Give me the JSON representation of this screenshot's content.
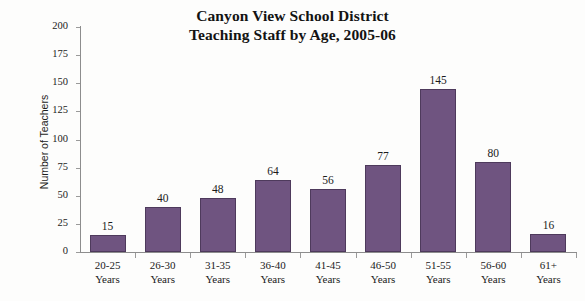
{
  "chart_data": {
    "type": "bar",
    "title": "Canyon View School District\nTeaching Staff by Age, 2005-06",
    "title_line1": "Canyon View School District",
    "title_line2": "Teaching Staff by Age, 2005-06",
    "xlabel": "",
    "ylabel": "Number of Teachers",
    "categories": [
      "20-25 Years",
      "26-30 Years",
      "31-35 Years",
      "36-40 Years",
      "41-45 Years",
      "46-50 Years",
      "51-55 Years",
      "56-60 Years",
      "61+ Years"
    ],
    "category_lines": [
      [
        "20-25",
        "Years"
      ],
      [
        "26-30",
        "Years"
      ],
      [
        "31-35",
        "Years"
      ],
      [
        "36-40",
        "Years"
      ],
      [
        "41-45",
        "Years"
      ],
      [
        "46-50",
        "Years"
      ],
      [
        "51-55",
        "Years"
      ],
      [
        "56-60",
        "Years"
      ],
      [
        "61+",
        "Years"
      ]
    ],
    "values": [
      15,
      40,
      48,
      64,
      56,
      77,
      145,
      80,
      16
    ],
    "value_labels": [
      "15",
      "40",
      "48",
      "64",
      "56",
      "77",
      "145",
      "80",
      "16"
    ],
    "ylim": [
      0,
      200
    ],
    "ytick_values": [
      0,
      25,
      50,
      75,
      100,
      125,
      150,
      175,
      200
    ],
    "ytick_labels": [
      "0",
      "25",
      "50",
      "75",
      "100",
      "125",
      "150",
      "175",
      "200"
    ],
    "grid": false,
    "legend": false,
    "bar_color": "#6f5480",
    "bar_edge_color": "#4e3a5c",
    "axis_color": "#8d8d8d",
    "background_color": "#fdfdfc",
    "text_color": "#1b1b1b"
  }
}
